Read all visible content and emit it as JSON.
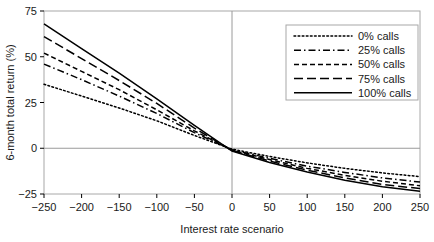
{
  "chart_data": {
    "type": "line",
    "title": "",
    "xlabel": "Interest rate scenario",
    "ylabel": "6-month total return (%)",
    "xlim": [
      -250,
      250
    ],
    "ylim": [
      -25,
      75
    ],
    "xticks": [
      -250,
      -200,
      -150,
      -100,
      -50,
      0,
      50,
      100,
      150,
      200,
      250
    ],
    "yticks": [
      -25,
      0,
      25,
      50,
      75
    ],
    "xticklabels": [
      "−250",
      "−200",
      "−150",
      "−100",
      "−50",
      "0",
      "50",
      "100",
      "150",
      "200",
      "250"
    ],
    "yticklabels": [
      "−25",
      "0",
      "25",
      "50",
      "75"
    ],
    "grid": false,
    "zero_lines": true,
    "legend_position": "upper right",
    "x": [
      -250,
      -200,
      -150,
      -100,
      -50,
      0,
      50,
      100,
      150,
      200,
      250
    ],
    "series": [
      {
        "name": "0% calls",
        "dash": "dotted",
        "values": [
          35.0,
          28.5,
          22.0,
          15.0,
          7.0,
          -0.5,
          -4.5,
          -8.0,
          -11.0,
          -13.5,
          -15.5
        ]
      },
      {
        "name": "25% calls",
        "dash": "dashdot",
        "values": [
          46.0,
          37.5,
          28.5,
          19.0,
          8.5,
          -0.8,
          -5.5,
          -9.8,
          -13.2,
          -16.2,
          -18.5
        ]
      },
      {
        "name": "50% calls",
        "dash": "dashed-small",
        "values": [
          52.0,
          42.0,
          32.0,
          21.0,
          9.5,
          -1.0,
          -6.2,
          -11.0,
          -14.8,
          -18.0,
          -20.5
        ]
      },
      {
        "name": "75% calls",
        "dash": "dashed-large",
        "values": [
          61.0,
          49.0,
          37.0,
          24.5,
          11.0,
          -1.2,
          -7.0,
          -12.0,
          -16.2,
          -19.8,
          -22.0
        ]
      },
      {
        "name": "100% calls",
        "dash": "solid",
        "values": [
          68.0,
          54.5,
          41.0,
          27.0,
          12.5,
          -1.5,
          -7.8,
          -13.0,
          -17.5,
          -21.0,
          -23.5
        ]
      }
    ]
  },
  "legend": {
    "entries": [
      {
        "label": "0% calls"
      },
      {
        "label": "25% calls"
      },
      {
        "label": "50% calls"
      },
      {
        "label": "75% calls"
      },
      {
        "label": "100% calls"
      }
    ]
  },
  "colors": {
    "line": "#000000",
    "axis": "#000000",
    "zero_line": "#9a9a9a",
    "frame": "#a8a8a8",
    "text": "#1a1a1a"
  }
}
